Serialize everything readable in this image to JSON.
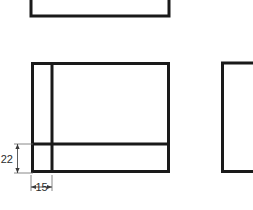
{
  "drawing": {
    "title": "Orthographic projection part views",
    "background_color": "#ffffff",
    "line_color": "#1a1a1a",
    "dimension_line_color": "#555555",
    "dimension_text_color": "#2b2b2b",
    "canvas": {
      "width": 253,
      "height": 210
    },
    "views": {
      "top_view": {
        "name": "top-view-channel-outline",
        "shape": "u-bracket-open-top",
        "stroke_width": 3,
        "points": "31,0 31,16 169,16 169,0"
      },
      "front_view": {
        "name": "front-view-rectangle",
        "shape": "rectangle-with-internal-divisions",
        "stroke_width": 3,
        "outer": {
          "x": 31,
          "y": 62,
          "width": 139,
          "height": 111
        },
        "vertical_rib_x": 52,
        "horizontal_rib_y": 144
      },
      "side_view": {
        "name": "side-view-bracket-outline",
        "shape": "c-bracket-open-right",
        "stroke_width": 3,
        "points": "253,62 221,62 221,173 253,173"
      }
    },
    "dimensions": [
      {
        "id": "vertical-dimension-22",
        "label": "22",
        "orientation": "vertical",
        "value": 22,
        "line_x": 17,
        "from_y": 144,
        "to_y": 173,
        "ext_line_start_x": 14,
        "ext_line_end_x": 33,
        "text_x": 13,
        "text_y": 163
      },
      {
        "id": "horizontal-dimension-15",
        "label": "15",
        "orientation": "horizontal",
        "value": 15,
        "line_y": 186,
        "from_x": 31,
        "to_x": 52,
        "ext_line_start_y": 175,
        "ext_line_end_y": 190,
        "text_x": 41,
        "text_y": 190
      }
    ]
  }
}
